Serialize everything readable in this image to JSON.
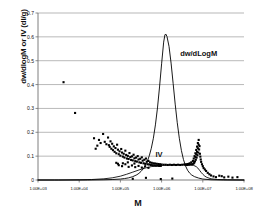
{
  "chart_data": {
    "type": "line",
    "title": "",
    "xlabel": "M",
    "ylabel": "dw/dlogM or IV (dl/g)",
    "xscale": "log",
    "xlim": [
      1000,
      100000000
    ],
    "ylim": [
      0,
      0.7
    ],
    "grid": true,
    "legend_position": "inline-annotations",
    "xticks": [
      {
        "value": 1000,
        "label": "1.00E+03"
      },
      {
        "value": 10000,
        "label": "1.00E+04"
      },
      {
        "value": 100000,
        "label": "1.00E+05"
      },
      {
        "value": 1000000,
        "label": "1.00E+06"
      },
      {
        "value": 10000000,
        "label": "1.00E+07"
      },
      {
        "value": 100000000,
        "label": "1.00E+08"
      }
    ],
    "yticks": [
      {
        "value": 0,
        "label": "0"
      },
      {
        "value": 0.1,
        "label": "0.1"
      },
      {
        "value": 0.2,
        "label": "0.2"
      },
      {
        "value": 0.3,
        "label": "0.3"
      },
      {
        "value": 0.4,
        "label": "0.4"
      },
      {
        "value": 0.5,
        "label": "0.5"
      },
      {
        "value": 0.6,
        "label": "0.6"
      },
      {
        "value": 0.7,
        "label": "0.7"
      }
    ],
    "annotations": [
      {
        "text": "dw/dLogM",
        "x_log": 6.45,
        "y": 0.53
      },
      {
        "text": "IV",
        "x_log": 5.85,
        "y": 0.105
      }
    ],
    "series": [
      {
        "name": "dw/dLogM",
        "type": "line",
        "peak_center_log": 6.05,
        "peak_height": 0.612,
        "peak_sigma_log": 0.3,
        "points_log": [
          [
            3.0,
            0.0
          ],
          [
            3.4,
            0.0
          ],
          [
            3.8,
            0.0
          ],
          [
            4.2,
            0.0
          ],
          [
            4.6,
            0.001
          ],
          [
            4.8,
            0.002
          ],
          [
            5.0,
            0.004
          ],
          [
            5.1,
            0.006
          ],
          [
            5.2,
            0.009
          ],
          [
            5.3,
            0.014
          ],
          [
            5.4,
            0.022
          ],
          [
            5.45,
            0.028
          ],
          [
            5.5,
            0.036
          ],
          [
            5.55,
            0.046
          ],
          [
            5.6,
            0.059
          ],
          [
            5.65,
            0.077
          ],
          [
            5.7,
            0.101
          ],
          [
            5.75,
            0.133
          ],
          [
            5.8,
            0.175
          ],
          [
            5.85,
            0.231
          ],
          [
            5.9,
            0.302
          ],
          [
            5.95,
            0.39
          ],
          [
            6.0,
            0.487
          ],
          [
            6.05,
            0.578
          ],
          [
            6.08,
            0.608
          ],
          [
            6.1,
            0.612
          ],
          [
            6.13,
            0.602
          ],
          [
            6.18,
            0.56
          ],
          [
            6.23,
            0.49
          ],
          [
            6.28,
            0.405
          ],
          [
            6.33,
            0.318
          ],
          [
            6.38,
            0.24
          ],
          [
            6.43,
            0.175
          ],
          [
            6.48,
            0.124
          ],
          [
            6.53,
            0.086
          ],
          [
            6.58,
            0.059
          ],
          [
            6.63,
            0.041
          ],
          [
            6.68,
            0.029
          ],
          [
            6.73,
            0.021
          ],
          [
            6.8,
            0.014
          ],
          [
            6.9,
            0.008
          ],
          [
            7.0,
            0.004
          ],
          [
            7.2,
            0.001
          ],
          [
            7.5,
            0.0
          ],
          [
            8.0,
            0.0
          ]
        ]
      },
      {
        "name": "IV",
        "type": "line",
        "points_log": [
          [
            3.0,
            0.0
          ],
          [
            3.5,
            0.0
          ],
          [
            4.0,
            0.001
          ],
          [
            4.3,
            0.002
          ],
          [
            4.6,
            0.005
          ],
          [
            4.8,
            0.009
          ],
          [
            5.0,
            0.016
          ],
          [
            5.15,
            0.024
          ],
          [
            5.3,
            0.033
          ],
          [
            5.45,
            0.042
          ],
          [
            5.6,
            0.05
          ],
          [
            5.75,
            0.056
          ],
          [
            5.9,
            0.06
          ],
          [
            6.05,
            0.062
          ],
          [
            6.2,
            0.063
          ],
          [
            6.35,
            0.064
          ],
          [
            6.5,
            0.064
          ],
          [
            6.6,
            0.064
          ],
          [
            6.7,
            0.063
          ],
          [
            6.78,
            0.061
          ],
          [
            6.84,
            0.056
          ],
          [
            6.88,
            0.05
          ],
          [
            6.92,
            0.041
          ],
          [
            6.96,
            0.032
          ],
          [
            7.0,
            0.024
          ],
          [
            7.05,
            0.016
          ],
          [
            7.1,
            0.011
          ],
          [
            7.2,
            0.005
          ],
          [
            7.35,
            0.002
          ],
          [
            7.6,
            0.001
          ],
          [
            8.0,
            0.0
          ]
        ]
      },
      {
        "name": "IV measured data",
        "type": "scatter",
        "points_log": [
          [
            3.62,
            0.41
          ],
          [
            3.9,
            0.281
          ],
          [
            4.58,
            0.193
          ],
          [
            4.62,
            0.16
          ],
          [
            4.66,
            0.15
          ],
          [
            4.7,
            0.178
          ],
          [
            4.72,
            0.146
          ],
          [
            4.74,
            0.139
          ],
          [
            4.76,
            0.162
          ],
          [
            4.78,
            0.131
          ],
          [
            4.8,
            0.152
          ],
          [
            4.82,
            0.125
          ],
          [
            4.84,
            0.141
          ],
          [
            4.86,
            0.118
          ],
          [
            4.88,
            0.134
          ],
          [
            4.9,
            0.112
          ],
          [
            4.92,
            0.148
          ],
          [
            4.94,
            0.127
          ],
          [
            4.96,
            0.108
          ],
          [
            4.98,
            0.12
          ],
          [
            5.0,
            0.102
          ],
          [
            5.02,
            0.13
          ],
          [
            5.04,
            0.115
          ],
          [
            5.06,
            0.098
          ],
          [
            5.08,
            0.11
          ],
          [
            5.1,
            0.094
          ],
          [
            5.12,
            0.123
          ],
          [
            5.14,
            0.105
          ],
          [
            5.16,
            0.09
          ],
          [
            5.18,
            0.101
          ],
          [
            5.2,
            0.088
          ],
          [
            5.22,
            0.113
          ],
          [
            5.24,
            0.096
          ],
          [
            5.26,
            0.084
          ],
          [
            5.28,
            0.099
          ],
          [
            5.3,
            0.082
          ],
          [
            5.32,
            0.106
          ],
          [
            5.34,
            0.091
          ],
          [
            5.36,
            0.079
          ],
          [
            5.38,
            0.094
          ],
          [
            5.4,
            0.077
          ],
          [
            5.42,
            0.1
          ],
          [
            5.44,
            0.086
          ],
          [
            5.46,
            0.074
          ],
          [
            5.48,
            0.089
          ],
          [
            5.5,
            0.072
          ],
          [
            5.52,
            0.095
          ],
          [
            5.54,
            0.081
          ],
          [
            5.56,
            0.07
          ],
          [
            5.58,
            0.085
          ],
          [
            5.6,
            0.068
          ],
          [
            5.62,
            0.09
          ],
          [
            5.64,
            0.077
          ],
          [
            5.66,
            0.066
          ],
          [
            5.68,
            0.08
          ],
          [
            5.7,
            0.065
          ],
          [
            5.72,
            0.074
          ],
          [
            5.74,
            0.063
          ],
          [
            5.76,
            0.072
          ],
          [
            5.78,
            0.062
          ],
          [
            5.8,
            0.07
          ],
          [
            5.82,
            0.061
          ],
          [
            5.84,
            0.069
          ],
          [
            5.86,
            0.06
          ],
          [
            5.88,
            0.068
          ],
          [
            5.9,
            0.06
          ],
          [
            5.92,
            0.067
          ],
          [
            5.94,
            0.059
          ],
          [
            5.96,
            0.066
          ],
          [
            5.98,
            0.059
          ],
          [
            6.0,
            0.065
          ],
          [
            6.05,
            0.064
          ],
          [
            6.1,
            0.064
          ],
          [
            6.15,
            0.063
          ],
          [
            6.2,
            0.064
          ],
          [
            6.25,
            0.063
          ],
          [
            6.3,
            0.064
          ],
          [
            6.35,
            0.063
          ],
          [
            6.4,
            0.064
          ],
          [
            6.45,
            0.063
          ],
          [
            6.5,
            0.064
          ],
          [
            6.55,
            0.065
          ],
          [
            6.58,
            0.064
          ],
          [
            6.6,
            0.066
          ],
          [
            6.62,
            0.063
          ],
          [
            6.64,
            0.067
          ],
          [
            6.66,
            0.064
          ],
          [
            6.68,
            0.07
          ],
          [
            6.7,
            0.065
          ],
          [
            6.72,
            0.074
          ],
          [
            6.74,
            0.066
          ],
          [
            6.76,
            0.08
          ],
          [
            6.77,
            0.068
          ],
          [
            6.78,
            0.09
          ],
          [
            6.79,
            0.072
          ],
          [
            6.8,
            0.1
          ],
          [
            6.81,
            0.078
          ],
          [
            6.82,
            0.112
          ],
          [
            6.83,
            0.085
          ],
          [
            6.84,
            0.126
          ],
          [
            6.85,
            0.094
          ],
          [
            6.86,
            0.14
          ],
          [
            6.87,
            0.104
          ],
          [
            6.88,
            0.155
          ],
          [
            6.89,
            0.115
          ],
          [
            6.9,
            0.168
          ],
          [
            6.91,
            0.128
          ],
          [
            6.92,
            0.142
          ],
          [
            6.93,
            0.11
          ],
          [
            6.94,
            0.098
          ],
          [
            6.95,
            0.086
          ],
          [
            6.96,
            0.076
          ],
          [
            6.98,
            0.066
          ],
          [
            7.0,
            0.058
          ],
          [
            7.02,
            0.05
          ],
          [
            7.05,
            0.044
          ],
          [
            7.08,
            0.038
          ],
          [
            7.12,
            0.03
          ],
          [
            7.16,
            0.024
          ],
          [
            7.2,
            0.019
          ],
          [
            7.26,
            0.015
          ],
          [
            7.32,
            0.012
          ],
          [
            7.4,
            0.018
          ],
          [
            7.46,
            0.016
          ],
          [
            7.52,
            0.011
          ],
          [
            7.62,
            0.014
          ],
          [
            7.72,
            0.01
          ],
          [
            7.84,
            0.012
          ],
          [
            5.3,
            0.005
          ],
          [
            5.62,
            0.009
          ],
          [
            5.98,
            0.004
          ],
          [
            6.26,
            0.006
          ],
          [
            4.48,
            0.168
          ],
          [
            4.52,
            0.155
          ],
          [
            4.44,
            0.144
          ],
          [
            4.4,
            0.131
          ],
          [
            4.36,
            0.175
          ],
          [
            4.96,
            0.062
          ],
          [
            5.04,
            0.058
          ],
          [
            5.12,
            0.066
          ],
          [
            5.2,
            0.055
          ],
          [
            5.28,
            0.061
          ],
          [
            5.36,
            0.054
          ],
          [
            5.44,
            0.059
          ],
          [
            5.52,
            0.052
          ],
          [
            5.6,
            0.057
          ],
          [
            5.68,
            0.051
          ],
          [
            4.9,
            0.072
          ],
          [
            4.94,
            0.068
          ],
          [
            5.06,
            0.07
          ],
          [
            5.18,
            0.074
          ],
          [
            5.34,
            0.069
          ],
          [
            6.86,
            0.118
          ],
          [
            6.88,
            0.133
          ],
          [
            6.9,
            0.148
          ],
          [
            6.84,
            0.108
          ],
          [
            6.82,
            0.096
          ]
        ]
      }
    ]
  }
}
